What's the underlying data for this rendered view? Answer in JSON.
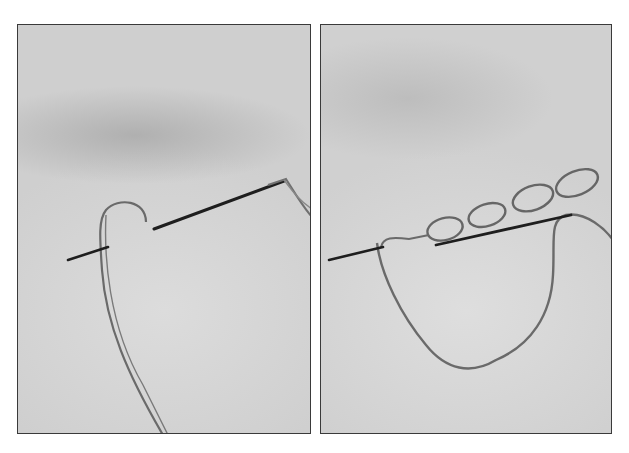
{
  "figure": {
    "panels": [
      {
        "id": "left",
        "subject": "needle inserted into fabric with thread loop forming"
      },
      {
        "id": "right",
        "subject": "chain of stitched loops with needle passing through"
      }
    ],
    "colors": {
      "background": "#ffffff",
      "fabric": "#d4d4d4",
      "border": "#3a3a3a",
      "needle": "#1e1e1e",
      "thread": "#6a6a6a"
    }
  }
}
